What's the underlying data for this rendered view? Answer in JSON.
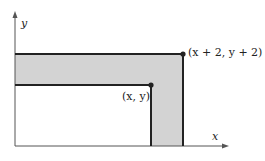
{
  "axes": {
    "x_label": "x",
    "y_label": "y"
  },
  "points": {
    "inner": {
      "label": "(x, y)",
      "label_x": "x",
      "label_y": "y"
    },
    "outer": {
      "label": "(x + 2, y + 2)",
      "label_x": "x + 2",
      "label_y": "y + 2"
    }
  },
  "colors": {
    "shade": "#d3d3d3",
    "line": "#222222",
    "axis": "#555555"
  }
}
